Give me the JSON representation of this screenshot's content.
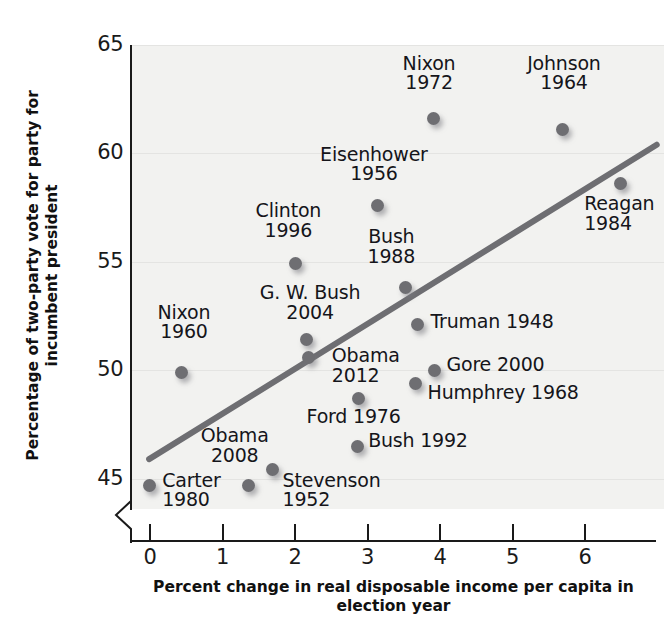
{
  "chart_data": {
    "type": "scatter",
    "title": "",
    "xlabel": "Percent change in real disposable income\nper capita in election year",
    "ylabel": "Percentage of two-party vote for party\nfor incumbent president",
    "xlim": [
      -0.25,
      7.1
    ],
    "ylim": [
      43.6,
      65.0
    ],
    "xticks": [
      0,
      1,
      2,
      3,
      4,
      5,
      6
    ],
    "yticks": [
      45,
      50,
      55,
      60,
      65
    ],
    "xtick_labels": [
      "0",
      "1",
      "2",
      "3",
      "4",
      "5",
      "6"
    ],
    "ytick_labels": [
      "45",
      "50",
      "55",
      "60",
      "65"
    ],
    "grid": true,
    "legend": "none",
    "axis_break": "y-axis break below 45",
    "point_color": "#6e6e72",
    "trend_color": "#6e6e72",
    "points": [
      {
        "name": "Carter",
        "year": "1980",
        "x": 0.0,
        "y": 44.7,
        "label": "Carter\n1980",
        "lx": 0.18,
        "ly": 44.85,
        "align": "left"
      },
      {
        "name": "Nixon",
        "year": "1960",
        "x": 0.45,
        "y": 49.9,
        "label": "Nixon\n1960",
        "lx": 0.48,
        "ly": 52.6,
        "align": "center"
      },
      {
        "name": "Obama",
        "year": "2008",
        "x": 1.37,
        "y": 44.7,
        "label": "Obama\n2008",
        "lx": 1.18,
        "ly": 46.9,
        "align": "center"
      },
      {
        "name": "Stevenson",
        "year": "1952",
        "x": 1.7,
        "y": 45.4,
        "label": "Stevenson\n1952",
        "lx": 1.84,
        "ly": 44.85,
        "align": "left"
      },
      {
        "name": "Clinton",
        "year": "1996",
        "x": 2.02,
        "y": 54.9,
        "label": "Clinton\n1996",
        "lx": 1.92,
        "ly": 57.3,
        "align": "center"
      },
      {
        "name": "G. W. Bush",
        "year": "2004",
        "x": 2.17,
        "y": 51.4,
        "label": "G. W. Bush\n2004",
        "lx": 2.22,
        "ly": 53.5,
        "align": "center"
      },
      {
        "name": "Obama",
        "year": "2012",
        "x": 2.2,
        "y": 50.6,
        "label": "Obama\n2012",
        "lx": 2.52,
        "ly": 50.6,
        "align": "left"
      },
      {
        "name": "Bush",
        "year": "1992",
        "x": 2.87,
        "y": 46.5,
        "label": "Bush 1992",
        "lx": 3.02,
        "ly": 46.7,
        "align": "left"
      },
      {
        "name": "Ford",
        "year": "1976",
        "x": 2.89,
        "y": 48.7,
        "label": "Ford 1976",
        "lx": 2.82,
        "ly": 47.8,
        "align": "center"
      },
      {
        "name": "Eisenhower",
        "year": "1956",
        "x": 3.15,
        "y": 57.6,
        "label": "Eisenhower\n1956",
        "lx": 3.1,
        "ly": 59.9,
        "align": "center"
      },
      {
        "name": "Bush",
        "year": "1988",
        "x": 3.54,
        "y": 53.8,
        "label": "Bush\n1988",
        "lx": 3.34,
        "ly": 56.1,
        "align": "center"
      },
      {
        "name": "Humphrey",
        "year": "1968",
        "x": 3.68,
        "y": 49.4,
        "label": "Humphrey 1968",
        "lx": 3.84,
        "ly": 48.9,
        "align": "left"
      },
      {
        "name": "Truman",
        "year": "1948",
        "x": 3.7,
        "y": 52.1,
        "label": "Truman 1948",
        "lx": 3.88,
        "ly": 52.2,
        "align": "left"
      },
      {
        "name": "Nixon",
        "year": "1972",
        "x": 3.92,
        "y": 61.6,
        "label": "Nixon\n1972",
        "lx": 3.86,
        "ly": 64.1,
        "align": "center"
      },
      {
        "name": "Gore",
        "year": "2000",
        "x": 3.93,
        "y": 50.0,
        "label": "Gore 2000",
        "lx": 4.1,
        "ly": 50.2,
        "align": "left"
      },
      {
        "name": "Johnson",
        "year": "1964",
        "x": 5.7,
        "y": 61.1,
        "label": "Johnson\n1964",
        "lx": 5.72,
        "ly": 64.1,
        "align": "center"
      },
      {
        "name": "Reagan",
        "year": "1984",
        "x": 6.5,
        "y": 58.6,
        "label": "Reagan\n1984",
        "lx": 6.0,
        "ly": 57.6,
        "align": "left"
      }
    ],
    "trendline": {
      "x0": 0.0,
      "y0": 45.9,
      "x1": 7.0,
      "y1": 60.4
    }
  }
}
